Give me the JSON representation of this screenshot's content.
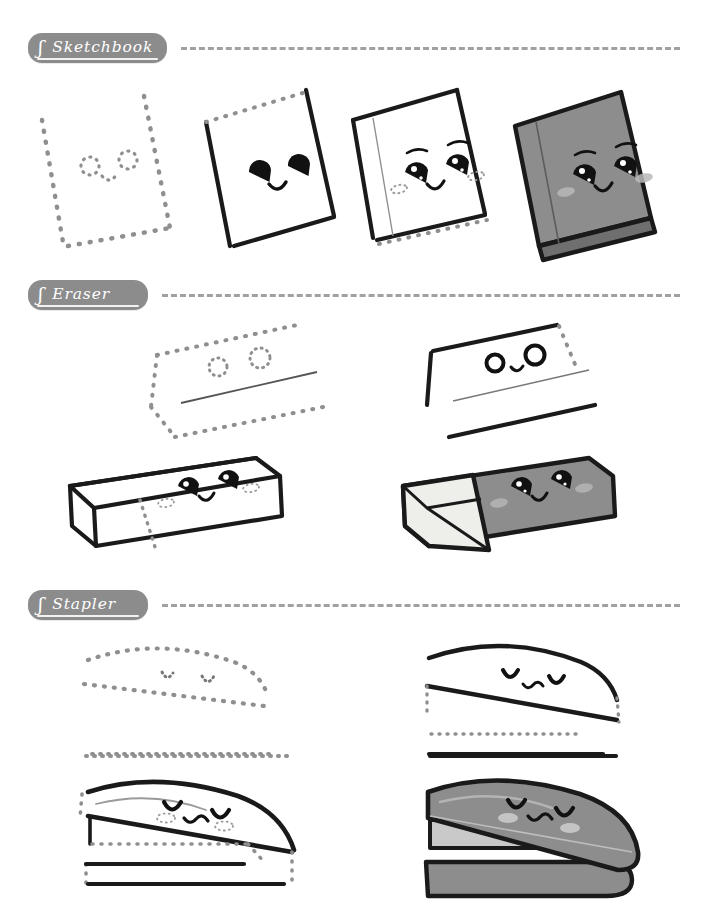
{
  "page": {
    "background_color": "#ffffff"
  },
  "style": {
    "chip_bg": "#8c8c8c",
    "chip_text_color": "#ffffff",
    "rule_color": "#9a9a9a",
    "ink_color": "#1a1a1a",
    "guide_color": "#8f8f8f",
    "fill_gray": "#8d8d8d",
    "fill_gray_dark": "#6f6f6f",
    "fill_gray_light": "#c9c9c9",
    "fill_cream": "#eeeeea",
    "blush_color": "#cfcfcf"
  },
  "sections": [
    {
      "id": "sketchbook",
      "label": "Sketchbook",
      "chip_mark": "ʃ",
      "steps": [
        {
          "index": 1,
          "name": "dotted-guide-outline",
          "caption": ""
        },
        {
          "index": 2,
          "name": "solid-outline-simple-face",
          "caption": ""
        },
        {
          "index": 3,
          "name": "spine-and-detailed-face",
          "caption": ""
        },
        {
          "index": 4,
          "name": "colored-final",
          "caption": ""
        }
      ]
    },
    {
      "id": "eraser",
      "label": "Eraser",
      "chip_mark": "ʃ",
      "steps": [
        {
          "index": 1,
          "name": "dotted-guide-outline",
          "caption": ""
        },
        {
          "index": 2,
          "name": "solid-outline-simple-face",
          "caption": ""
        },
        {
          "index": 3,
          "name": "three-d-box-detailed-face",
          "caption": ""
        },
        {
          "index": 4,
          "name": "colored-final",
          "caption": ""
        }
      ]
    },
    {
      "id": "stapler",
      "label": "Stapler",
      "chip_mark": "ʃ",
      "steps": [
        {
          "index": 1,
          "name": "dotted-guide-outline",
          "caption": ""
        },
        {
          "index": 2,
          "name": "solid-outline-simple-face",
          "caption": ""
        },
        {
          "index": 3,
          "name": "body-and-base-detailed-face",
          "caption": ""
        },
        {
          "index": 4,
          "name": "colored-final",
          "caption": ""
        }
      ]
    }
  ]
}
